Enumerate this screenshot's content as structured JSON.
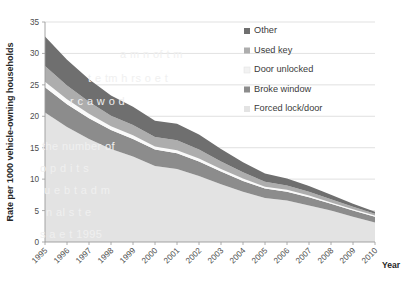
{
  "chart_data": {
    "type": "area",
    "stacked": true,
    "title": "",
    "subtitle": "",
    "xlabel": "Year",
    "ylabel": "Rate per 1000 vehicle-owning households",
    "categories": [
      1995,
      1996,
      1997,
      1998,
      1999,
      2000,
      2001,
      2002,
      2003,
      2004,
      2005,
      2006,
      2007,
      2008,
      2009,
      2010
    ],
    "x_tick_labels": [
      "1995",
      "1996",
      "1997",
      "1998",
      "1999",
      "2000",
      "2001",
      "2002",
      "2003",
      "2004",
      "2005",
      "2006",
      "2007",
      "2008",
      "2009",
      "2010"
    ],
    "y_tick_labels": [
      "0",
      "5",
      "10",
      "15",
      "20",
      "25",
      "30",
      "35"
    ],
    "y_ticks": [
      0,
      5,
      10,
      15,
      20,
      25,
      30,
      35
    ],
    "ylim": [
      0,
      35
    ],
    "grid": "horizontal",
    "legend_position": "right-top",
    "stack_order_bottom_to_top": [
      "Forced lock/door",
      "Broke window",
      "Door unlocked",
      "Used key",
      "Other"
    ],
    "series": [
      {
        "name": "Forced lock/door",
        "color": "#e3e3e3",
        "values": [
          20.6,
          18.3,
          16.4,
          14.8,
          13.6,
          12.1,
          11.6,
          10.5,
          9.2,
          8.0,
          7.0,
          6.6,
          5.8,
          5.0,
          4.0,
          3.1
        ]
      },
      {
        "name": "Broke window",
        "color": "#8c8c8c",
        "values": [
          4.0,
          3.6,
          3.3,
          3.0,
          2.8,
          2.6,
          2.5,
          2.3,
          2.0,
          1.7,
          1.5,
          1.4,
          1.3,
          1.1,
          1.0,
          0.9
        ]
      },
      {
        "name": "Door unlocked",
        "color": "#fafafa",
        "values": [
          0.9,
          0.8,
          0.7,
          0.6,
          0.6,
          0.5,
          0.5,
          0.5,
          0.4,
          0.4,
          0.3,
          0.3,
          0.3,
          0.2,
          0.2,
          0.2
        ]
      },
      {
        "name": "Used key",
        "color": "#adadad",
        "values": [
          2.5,
          2.2,
          1.9,
          1.7,
          1.6,
          1.5,
          1.6,
          1.4,
          1.2,
          1.0,
          0.8,
          0.7,
          0.6,
          0.5,
          0.4,
          0.3
        ]
      },
      {
        "name": "Other",
        "color": "#6f6f6f",
        "values": [
          4.7,
          4.1,
          3.6,
          3.2,
          2.9,
          2.6,
          2.6,
          2.4,
          2.0,
          1.6,
          1.3,
          1.1,
          0.9,
          0.7,
          0.5,
          0.3
        ]
      }
    ],
    "totals": [
      32.7,
      29.0,
      25.9,
      23.3,
      21.5,
      19.3,
      18.8,
      17.1,
      14.8,
      12.7,
      10.9,
      10.1,
      8.9,
      7.5,
      6.1,
      4.8
    ]
  },
  "legend": {
    "items": [
      {
        "label": "Other",
        "color": "#6f6f6f",
        "swatch": true
      },
      {
        "label": "Used key",
        "color": "#adadad",
        "swatch": true
      },
      {
        "label": "Door unlocked",
        "color": "#f2f2f2",
        "swatch": true
      },
      {
        "label": "Broke window",
        "color": "#8c8c8c",
        "swatch": true
      },
      {
        "label": "Forced lock/door",
        "color": "#e3e3e3",
        "swatch": true
      }
    ]
  },
  "axes": {
    "y_title": "Rate per 1000 vehicle-owning households",
    "x_title": "Year"
  },
  "background_text": {
    "lines": [
      "a m n of t m",
      "t e tm h rs o e t",
      "r c a w o d",
      "the number of",
      "o p d i t s",
      "u e b t a d m",
      "n al s t e",
      "s a e t  1995"
    ]
  }
}
